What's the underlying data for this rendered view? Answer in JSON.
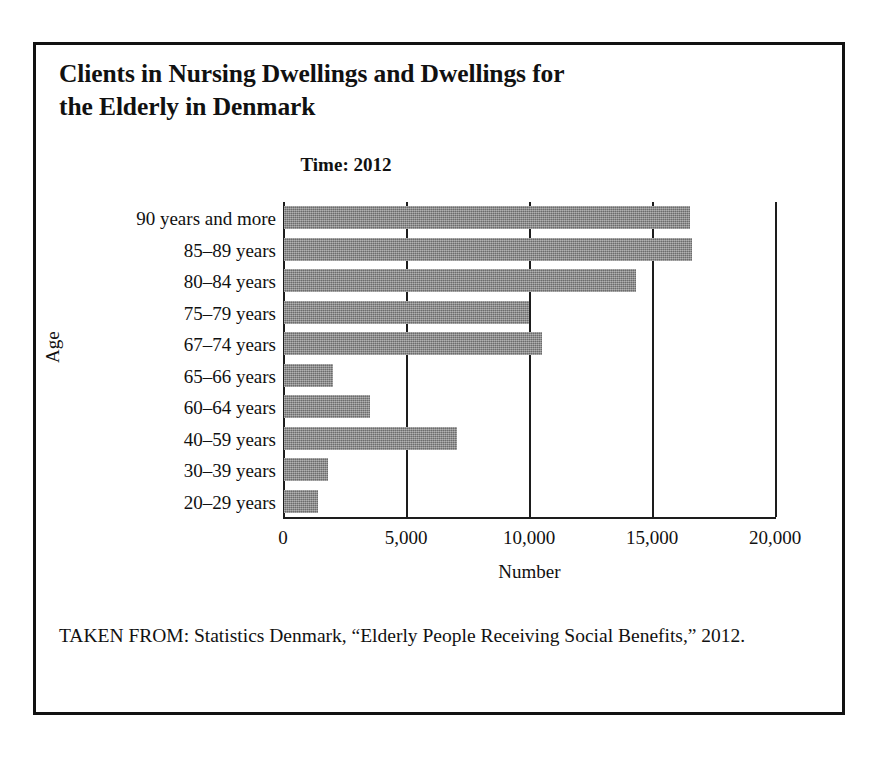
{
  "figure": {
    "title": "Clients in Nursing Dwellings and Dwellings for the Elderly in Denmark",
    "subtitle": "Time: 2012",
    "source_caption": "TAKEN FROM: Statistics Denmark, “Elderly People Receiving Social Benefits,” 2012."
  },
  "chart_data": {
    "type": "bar",
    "orientation": "horizontal",
    "title": "Clients in Nursing Dwellings and Dwellings for the Elderly in Denmark",
    "subtitle": "Time: 2012",
    "xlabel": "Number",
    "ylabel": "Age",
    "xlim": [
      0,
      20000
    ],
    "xticks": [
      0,
      5000,
      10000,
      15000,
      20000
    ],
    "xticklabels": [
      "0",
      "5,000",
      "10,000",
      "15,000",
      "20,000"
    ],
    "grid": "vertical-only",
    "legend": "none",
    "bar_color": "#868686",
    "categories": [
      "90 years and more",
      "85–89 years",
      "80–84 years",
      "75–79 years",
      "67–74 years",
      "65–66 years",
      "60–64 years",
      "40–59 years",
      "30–39 years",
      "20–29 years"
    ],
    "values": [
      16500,
      16600,
      14300,
      9950,
      10500,
      2000,
      3500,
      7050,
      1800,
      1400
    ]
  }
}
